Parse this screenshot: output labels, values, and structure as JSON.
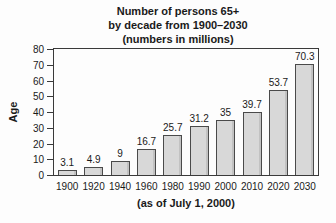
{
  "chart_data": {
    "type": "bar",
    "title_lines": [
      "Number of persons 65+",
      "by decade from 1900–2030",
      "(numbers in millions)"
    ],
    "categories": [
      "1900",
      "1920",
      "1940",
      "1960",
      "1980",
      "1990",
      "2000",
      "2010",
      "2020",
      "2030"
    ],
    "values": [
      3.1,
      4.9,
      9,
      16.7,
      25.7,
      31.2,
      35,
      39.7,
      53.7,
      70.3
    ],
    "value_labels": [
      "3.1",
      "4.9",
      "9",
      "16.7",
      "25.7",
      "31.2",
      "35",
      "39.7",
      "53.7",
      "70.3"
    ],
    "xlabel": "",
    "ylabel": "Age",
    "ylim": [
      0,
      80
    ],
    "yticks": [
      0,
      10,
      20,
      30,
      40,
      50,
      60,
      70,
      80
    ],
    "caption": "(as of July 1, 2000)",
    "grid": false,
    "legend": "none",
    "colors": {
      "bar_fill": "#d8d8d8",
      "bar_border": "#4a4a4a",
      "axis": "#3a3a3a",
      "text": "#1a1a1a",
      "background": "#fdfdfd"
    }
  }
}
